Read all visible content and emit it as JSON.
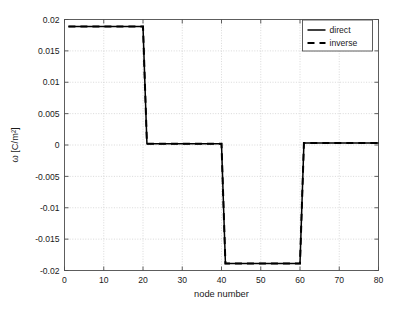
{
  "chart_data": {
    "type": "line",
    "title": "",
    "subtitle": "",
    "xlabel": "node number",
    "ylabel": "ω [C/m²]",
    "xlim": [
      0,
      80
    ],
    "ylim": [
      -0.02,
      0.02
    ],
    "xticks": [
      0,
      10,
      20,
      30,
      40,
      50,
      60,
      70,
      80
    ],
    "xticklabels": [
      "0",
      "10",
      "20",
      "30",
      "40",
      "50",
      "60",
      "70",
      "80"
    ],
    "yticks": [
      -0.02,
      -0.015,
      -0.01,
      -0.005,
      0,
      0.005,
      0.01,
      0.015,
      0.02
    ],
    "yticklabels": [
      "-0.02",
      "-0.015",
      "-0.01",
      "-0.005",
      "0",
      "0.005",
      "0.01",
      "0.015",
      "0.02"
    ],
    "grid": true,
    "grid_color": "#c8c8c8",
    "legend_position": "upper right",
    "series": [
      {
        "name": "direct",
        "style": "solid",
        "color": "#000000",
        "x": [
          1,
          20,
          20.5,
          21,
          40,
          40.5,
          41,
          60,
          60.5,
          61,
          80
        ],
        "values": [
          0.0189,
          0.0189,
          0.0095,
          0.0002,
          0.0002,
          -0.0094,
          -0.0189,
          -0.0189,
          -0.0093,
          0.0003,
          0.0003
        ]
      },
      {
        "name": "inverse",
        "style": "dashed",
        "color": "#000000",
        "x": [
          1,
          20,
          20.5,
          21,
          40,
          40.5,
          41,
          60,
          60.5,
          61,
          80
        ],
        "values": [
          0.0189,
          0.0189,
          0.0095,
          0.0002,
          0.0002,
          -0.0094,
          -0.0189,
          -0.0189,
          -0.0093,
          0.0003,
          0.0003
        ]
      }
    ],
    "annotations": []
  },
  "legend": {
    "entries": [
      {
        "label": "direct"
      },
      {
        "label": "inverse"
      }
    ]
  }
}
